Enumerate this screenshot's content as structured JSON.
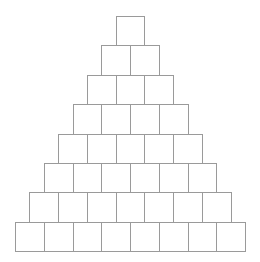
{
  "diagram": {
    "type": "block-pyramid",
    "rows": 8,
    "cells_per_row": [
      1,
      2,
      3,
      4,
      5,
      6,
      7,
      8
    ],
    "cell_width": 28.75,
    "cell_height": 29.4,
    "center_x": 130,
    "top_y": 16,
    "line_color": "#9a9a9a",
    "fill_color": "#ffffff"
  }
}
